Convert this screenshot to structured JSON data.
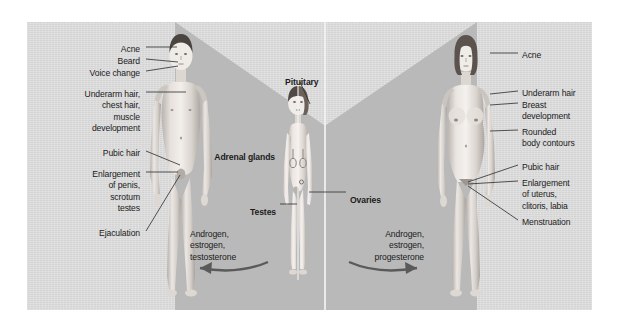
{
  "diagram": {
    "panel_color": "#d9d9d9",
    "wedge_color": "#b9b9b9",
    "text_color": "#1b1b1b"
  },
  "male_side": {
    "labels": [
      {
        "text": "Acne",
        "x": 140,
        "y": 44,
        "align": "right"
      },
      {
        "text": "Beard",
        "x": 140,
        "y": 56,
        "align": "right"
      },
      {
        "text": "Voice change",
        "x": 140,
        "y": 68,
        "align": "right"
      },
      {
        "text": "Underarm hair,\nchest hair,\nmuscle\ndevelopment",
        "x": 140,
        "y": 89,
        "align": "right"
      },
      {
        "text": "Pubic hair",
        "x": 140,
        "y": 148,
        "align": "right"
      },
      {
        "text": "Enlargement\nof penis,\nscrotum\ntestes",
        "x": 140,
        "y": 169,
        "align": "right"
      },
      {
        "text": "Ejaculation",
        "x": 140,
        "y": 228,
        "align": "right"
      }
    ],
    "hormones": {
      "text": "Androgen,\nestrogen,\ntestosterone",
      "x": 190,
      "y": 229,
      "align": "left"
    }
  },
  "center": {
    "labels": [
      {
        "text": "Pituitary",
        "x": 285,
        "y": 77,
        "align": "left",
        "bold": true
      },
      {
        "text": "Adrenal glands",
        "x": 275,
        "y": 152,
        "align": "right",
        "bold": true
      },
      {
        "text": "Ovaries",
        "x": 350,
        "y": 195,
        "align": "left",
        "bold": true
      },
      {
        "text": "Testes",
        "x": 276,
        "y": 207,
        "align": "right",
        "bold": true
      }
    ]
  },
  "female_side": {
    "labels": [
      {
        "text": "Acne",
        "x": 522,
        "y": 50,
        "align": "left"
      },
      {
        "text": "Underarm hair",
        "x": 522,
        "y": 88,
        "align": "left"
      },
      {
        "text": "Breast\ndevelopment",
        "x": 522,
        "y": 100,
        "align": "left"
      },
      {
        "text": "Rounded\nbody contours",
        "x": 522,
        "y": 127,
        "align": "left"
      },
      {
        "text": "Pubic hair",
        "x": 522,
        "y": 162,
        "align": "left"
      },
      {
        "text": "Enlargement\nof uterus,\nclitoris, labia",
        "x": 522,
        "y": 178,
        "align": "left"
      },
      {
        "text": "Menstruation",
        "x": 522,
        "y": 217,
        "align": "left"
      }
    ],
    "hormones": {
      "text": "Androgen,\nestrogen,\nprogesterone",
      "x": 424,
      "y": 229,
      "align": "right"
    }
  },
  "figures": {
    "male": {
      "name": "adolescent-male-figure"
    },
    "child": {
      "name": "prepubescent-child-figure"
    },
    "female": {
      "name": "adolescent-female-figure"
    }
  }
}
